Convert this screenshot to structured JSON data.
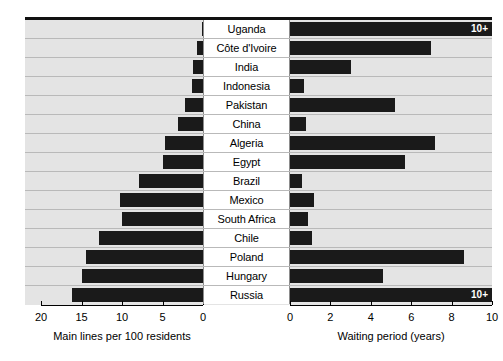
{
  "chart_data": {
    "type": "bar",
    "orientation": "horizontal",
    "layout": "bidirectional-pyramid",
    "title": "",
    "categories": [
      "Uganda",
      "Côte d'Ivoire",
      "India",
      "Indonesia",
      "Pakistan",
      "China",
      "Algeria",
      "Egypt",
      "Brazil",
      "Mexico",
      "South Africa",
      "Chile",
      "Poland",
      "Hungary",
      "Russia"
    ],
    "series": [
      {
        "name": "Main lines per 100 residents",
        "side": "left",
        "xlabel": "Main lines per 100 residents",
        "unit": "lines per 100 residents",
        "axis_direction": "right-to-left",
        "xlim": [
          0,
          21
        ],
        "ticks": [
          20,
          15,
          10,
          5,
          0
        ],
        "values": [
          0.15,
          0.7,
          1.2,
          1.4,
          2.2,
          3.1,
          4.7,
          4.9,
          7.9,
          10.3,
          10.0,
          12.8,
          14.4,
          15.0,
          16.2
        ],
        "labels": [
          "",
          "",
          "",
          "",
          "",
          "",
          "",
          "",
          "",
          "",
          "",
          "",
          "",
          "",
          ""
        ]
      },
      {
        "name": "Waiting period (years)",
        "side": "right",
        "xlabel": "Waiting period (years)",
        "unit": "years",
        "axis_direction": "left-to-right",
        "xlim": [
          0,
          10.1
        ],
        "ticks": [
          0,
          2,
          4,
          6,
          8,
          10
        ],
        "values": [
          10.1,
          7.0,
          3.0,
          0.7,
          5.2,
          0.8,
          7.2,
          5.7,
          0.6,
          1.2,
          0.9,
          1.1,
          8.6,
          4.6,
          10.1
        ],
        "labels": [
          "10+",
          "",
          "",
          "",
          "",
          "",
          "",
          "",
          "",
          "",
          "",
          "",
          "",
          "",
          "10+"
        ]
      }
    ],
    "grid": true,
    "legend": "none",
    "colors": {
      "bar": "#1a1a1a",
      "plot_background": "#e4e4e4",
      "label_background": "#ffffff",
      "gridline": "#b9b9b9",
      "axis": "#000000",
      "tag_text": "#ffffff"
    },
    "annotations": [
      {
        "category": "Uganda",
        "side": "right",
        "text": "10+"
      },
      {
        "category": "Russia",
        "side": "right",
        "text": "10+"
      }
    ]
  },
  "axes": {
    "left": {
      "title": "Main lines per 100 residents",
      "tick_labels": [
        "20",
        "15",
        "10",
        "5",
        "0"
      ]
    },
    "right": {
      "title": "Waiting period (years)",
      "tick_labels": [
        "0",
        "2",
        "4",
        "6",
        "8",
        "10"
      ]
    }
  }
}
